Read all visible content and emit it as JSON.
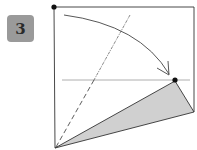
{
  "step": {
    "number": "3",
    "badge_color": "#9a9a9a"
  },
  "diagram": {
    "type": "origami-fold-step",
    "paper_color": "#ffffff",
    "line_color": "#333333",
    "shaded_color": "#d0d0d0",
    "elements": [
      "square-paper-outline",
      "corner-dot-top-left",
      "curved-fold-arrow",
      "dash-dot-fold-line",
      "horizontal-reference-line",
      "target-dot",
      "dashed-valley-line",
      "shaded-folded-flap"
    ]
  }
}
